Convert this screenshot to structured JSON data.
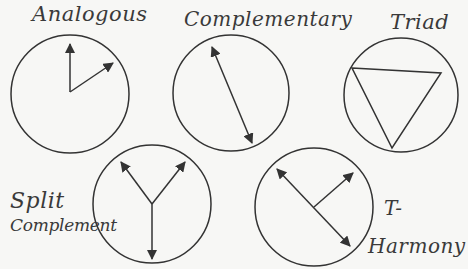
{
  "colors": {
    "background": "#f7f7f5",
    "ink": "#333333"
  },
  "wheels": [
    {
      "id": "analogous",
      "label": "Analogous",
      "shape": "two-arrows-adjacent"
    },
    {
      "id": "complementary",
      "label": "Complementary",
      "shape": "double-arrow-opposite"
    },
    {
      "id": "triad",
      "label": "Triad",
      "shape": "inscribed-triangle"
    },
    {
      "id": "split-complement",
      "label_line1": "Split",
      "label_line2": "Complement",
      "shape": "y-three-arrows"
    },
    {
      "id": "t-harmony",
      "label_line1": "T-",
      "label_line2": "Harmony",
      "shape": "t-arrows"
    }
  ]
}
